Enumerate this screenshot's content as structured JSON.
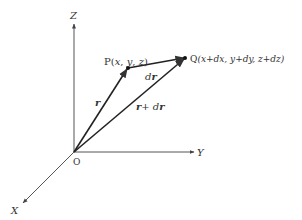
{
  "diagram": {
    "type": "3d-vector-diagram",
    "axes": {
      "z_label": "Z",
      "y_label": "Y",
      "x_label": "X",
      "origin_label": "O"
    },
    "points": {
      "P": {
        "name": "P",
        "coords": "(x, y, z)",
        "label_prefix": "P(",
        "label_x": "x",
        "label_y": "y",
        "label_z": "z",
        "label_suffix": ")"
      },
      "Q": {
        "name": "Q",
        "coords": "(x+dx, y+dy, z+dz)"
      }
    },
    "vectors": {
      "r": {
        "label": "r",
        "from": "O",
        "to": "P"
      },
      "dr": {
        "label_d": "d",
        "label_r": "r",
        "from": "P",
        "to": "Q"
      },
      "r_plus_dr": {
        "label_r1": "r",
        "label_plus": "+ ",
        "label_d": "d",
        "label_r2": "r",
        "from": "O",
        "to": "Q"
      }
    },
    "colors": {
      "axis": "#555555",
      "vector": "#222222",
      "text": "#333333",
      "background": "#ffffff"
    }
  }
}
